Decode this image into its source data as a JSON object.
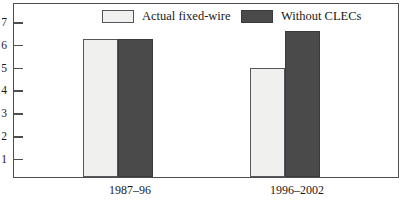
{
  "chart_data": {
    "type": "bar",
    "title": "",
    "subtitle": "",
    "xlabel": "",
    "ylabel": "",
    "categories": [
      "1987–96",
      "1996–2002"
    ],
    "series": [
      {
        "name": "Actual fixed-wire",
        "color": "#f0f0ee",
        "values": [
          6.15,
          4.85
        ]
      },
      {
        "name": "Without CLECs",
        "color": "#4a4a4a",
        "values": [
          6.15,
          6.5
        ]
      }
    ],
    "ylim": [
      0,
      7.7
    ],
    "yticks": [
      1,
      2,
      3,
      4,
      5,
      6,
      7
    ],
    "ytick_labels": [
      "1",
      "2",
      "3",
      "4",
      "5",
      "6",
      "7"
    ],
    "grid": false,
    "legend_position": "top-inside",
    "frame": true,
    "annotations": []
  },
  "legend": {
    "entries": [
      {
        "label": "Actual fixed-wire",
        "swatch": "light-swatch"
      },
      {
        "label": "Without CLECs",
        "swatch": "dark-swatch"
      }
    ]
  },
  "axes": {
    "y_tick_labels": [
      "7",
      "6",
      "5",
      "4",
      "3",
      "2",
      "1"
    ],
    "x_tick_labels": [
      "1987–96",
      "1996–2002"
    ]
  },
  "colors": {
    "light_bar": "#f0f0ee",
    "dark_bar": "#4a4a4a",
    "axis": "#4e4e52",
    "text": "#1a1a1a",
    "background": "#ffffff"
  }
}
